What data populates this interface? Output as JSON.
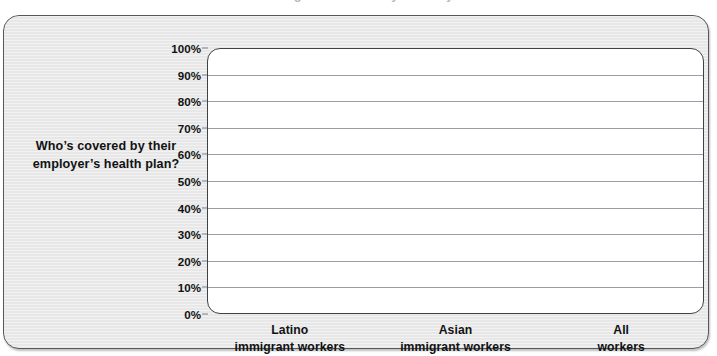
{
  "page": {
    "cropped_title_fragment": "immigrant workers by industry"
  },
  "question_label": "Who’s covered by their employer’s health plan?",
  "chart_data": {
    "type": "bar",
    "title": "",
    "xlabel": "",
    "ylabel": "",
    "categories": [
      "Latino\nimmigrant workers",
      "Asian\nimmigrant workers",
      "All\nworkers"
    ],
    "category_lines": [
      [
        "Latino",
        "immigrant workers"
      ],
      [
        "Asian",
        "immigrant workers"
      ],
      [
        "All",
        "workers"
      ]
    ],
    "values": [
      null,
      null,
      null
    ],
    "ylim": [
      0,
      100
    ],
    "ytick_labels": [
      "100%",
      "90%",
      "80%",
      "70%",
      "60%",
      "50%",
      "40%",
      "30%",
      "20%",
      "10%",
      "0%"
    ],
    "ytick_values": [
      100,
      90,
      80,
      70,
      60,
      50,
      40,
      30,
      20,
      10,
      0
    ],
    "grid": true,
    "grid_orientation": "horizontal",
    "legend": false,
    "legend_position": "none",
    "note": "Blank chart template — axes and gridlines drawn, no bars plotted"
  },
  "colors": {
    "card_background": "#e9e9e9",
    "card_border": "#55585c",
    "plot_background": "#ffffff",
    "plot_border": "#3e4146",
    "gridline": "#9a9da1",
    "text": "#111214",
    "page_background": "#ffffff"
  }
}
